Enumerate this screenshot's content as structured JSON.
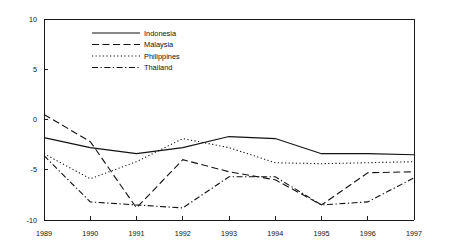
{
  "chart_data": {
    "type": "line",
    "title": "",
    "xlabel": "",
    "ylabel": "",
    "x": [
      1989,
      1990,
      1991,
      1992,
      1993,
      1994,
      1995,
      1996,
      1997
    ],
    "categories": [
      "1989",
      "1990",
      "1991",
      "1992",
      "1993",
      "1994",
      "1995",
      "1996",
      "1997"
    ],
    "xlim": [
      1989,
      1997
    ],
    "ylim": [
      -10,
      10
    ],
    "ytick_labels": [
      "10",
      "5",
      "0",
      "-5",
      "-10"
    ],
    "ytick_values": [
      10,
      5,
      0,
      -5,
      -10
    ],
    "grid": false,
    "legend_position": "top-center",
    "series": [
      {
        "name": "Indonesia",
        "style": "solid",
        "values": [
          -1.8,
          -2.8,
          -3.4,
          -2.8,
          -1.7,
          -1.9,
          -3.4,
          -3.4,
          -3.5
        ]
      },
      {
        "name": "Malaysia",
        "style": "dashed",
        "values": [
          0.5,
          -2.2,
          -8.8,
          -4.0,
          -5.2,
          -6.0,
          -8.5,
          -5.3,
          -5.2
        ]
      },
      {
        "name": "Philippines",
        "style": "dotted",
        "values": [
          -3.4,
          -5.9,
          -4.2,
          -1.9,
          -2.8,
          -4.3,
          -4.4,
          -4.3,
          -4.2
        ]
      },
      {
        "name": "Thailand",
        "style": "dashdot",
        "values": [
          -3.6,
          -8.2,
          -8.5,
          -8.8,
          -5.7,
          -5.7,
          -8.5,
          -8.2,
          -5.8
        ]
      }
    ],
    "colors": {
      "axis": "#1a1a1a",
      "line": "#111111",
      "background": "#ffffff"
    }
  },
  "legend": {
    "items": [
      {
        "label": "Indonesia"
      },
      {
        "label": "Malaysia"
      },
      {
        "label": "Philippines"
      },
      {
        "label": "Thailand"
      }
    ]
  }
}
